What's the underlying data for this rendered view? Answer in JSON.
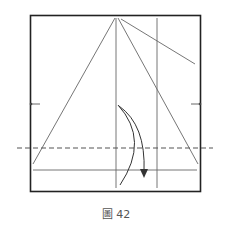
{
  "figure": {
    "caption": "圖 42",
    "type": "origami-fold-diagram"
  },
  "colors": {
    "paper_border": "#222222",
    "crease": "#666666",
    "arrow": "#333333",
    "dashed_fold": "#555555"
  },
  "elements": {
    "paper_square": {
      "x": 30,
      "y": 15,
      "width": 170,
      "height": 177
    },
    "valley_fold_line": {
      "style": "dashed",
      "y": 148
    },
    "arrow": {
      "direction": "down",
      "meaning": "fold-down"
    },
    "reference_marks": [
      "left-midpoint",
      "right-midpoint"
    ]
  }
}
